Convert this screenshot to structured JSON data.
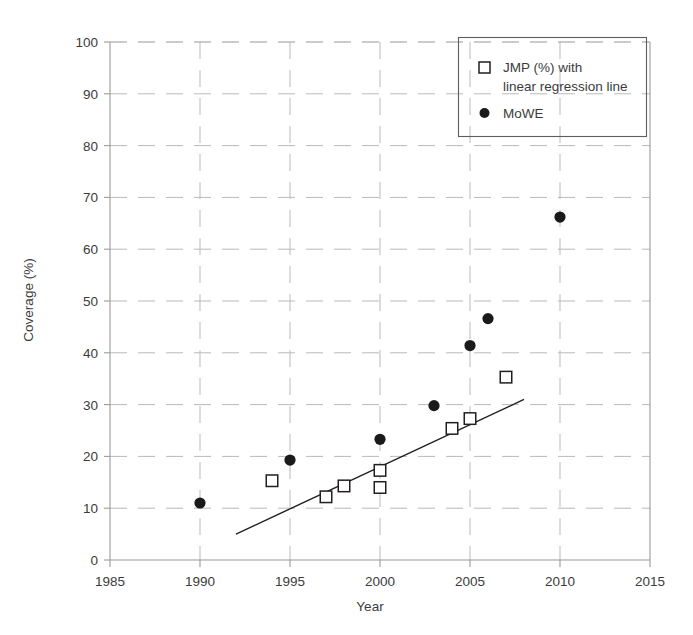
{
  "chart_data": {
    "type": "scatter",
    "title": "",
    "xlabel": "Year",
    "ylabel": "Coverage (%)",
    "xlim": [
      1985,
      2015
    ],
    "ylim": [
      0,
      100
    ],
    "xticks": [
      1985,
      1990,
      1995,
      2000,
      2005,
      2010,
      2015
    ],
    "yticks": [
      0,
      10,
      20,
      30,
      40,
      50,
      60,
      70,
      80,
      90,
      100
    ],
    "grid": true,
    "legend_position": "top-right",
    "series": [
      {
        "name": "JMP (%) with linear regression line",
        "marker": "open-square",
        "color": "#231f20",
        "points": [
          {
            "x": 1994,
            "y": 15.3
          },
          {
            "x": 1997,
            "y": 12.2
          },
          {
            "x": 1998,
            "y": 14.3
          },
          {
            "x": 2000,
            "y": 17.3
          },
          {
            "x": 2000,
            "y": 14.0
          },
          {
            "x": 2004,
            "y": 25.4
          },
          {
            "x": 2005,
            "y": 27.3
          },
          {
            "x": 2007,
            "y": 35.3
          }
        ]
      },
      {
        "name": "MoWE",
        "marker": "filled-circle",
        "color": "#1a1a1a",
        "points": [
          {
            "x": 1990,
            "y": 11.0
          },
          {
            "x": 1995,
            "y": 19.3
          },
          {
            "x": 2000,
            "y": 23.3
          },
          {
            "x": 2003,
            "y": 29.8
          },
          {
            "x": 2005,
            "y": 41.4
          },
          {
            "x": 2006,
            "y": 46.6
          },
          {
            "x": 2010,
            "y": 66.2
          }
        ]
      }
    ],
    "regression_line": {
      "name": "linear regression line",
      "x_start": 1992.0,
      "y_start": 5.0,
      "x_end": 2008.0,
      "y_end": 31.0
    },
    "annotations": []
  },
  "legend": {
    "entries": [
      {
        "marker": "open-square",
        "line1": "JMP (%) with",
        "line2": "linear regression line"
      },
      {
        "marker": "filled-circle",
        "line1": "MoWE",
        "line2": ""
      }
    ]
  }
}
